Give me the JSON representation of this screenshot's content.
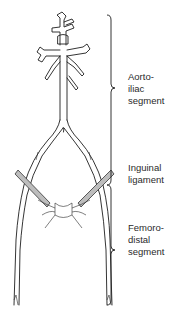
{
  "figure": {
    "type": "anatomical-diagram",
    "colors": {
      "line": "#1e1e1e",
      "ligament_fill": "#bdbdbd",
      "text": "#2a2a2a",
      "background": "#ffffff"
    }
  },
  "labels": {
    "aortoiliac": "Aorto-\niliac\nsegment",
    "inguinal": "Inguinal\nligament",
    "femorodistal": "Femoro-\ndistal\nsegment"
  },
  "braces": [
    {
      "name": "aortoiliac-brace",
      "y_start": 15,
      "y_end": 185
    },
    {
      "name": "femorodistal-brace",
      "y_start": 185,
      "y_end": 305
    }
  ]
}
